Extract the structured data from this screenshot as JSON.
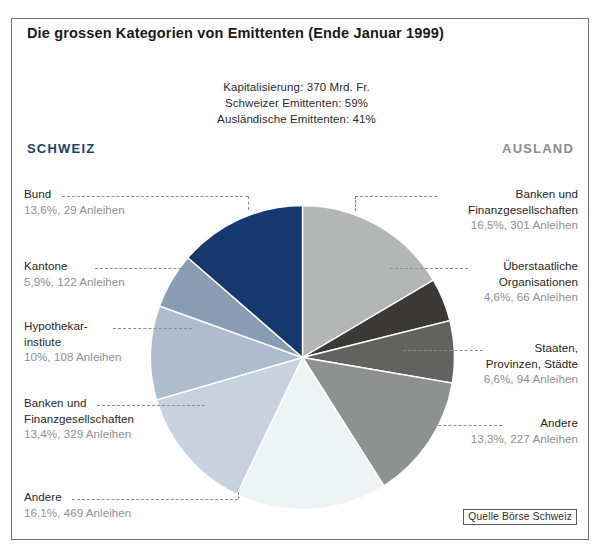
{
  "title": "Die grossen Kategorien von Emittenten (Ende Januar 1999)",
  "subtitle": {
    "line1": "Kapitalisierung: 370 Mrd. Fr.",
    "line2": "Schweizer Emittenten: 59%",
    "line3": "Ausländische Emittenten: 41%"
  },
  "regions": {
    "domestic": "SCHWEIZ",
    "foreign": "AUSLAND"
  },
  "source": "Quelle Börse Schweiz",
  "colors": {
    "navy": "#16386e",
    "schweiz_heading": "#22406b",
    "ausland_heading": "#8b8d90",
    "frame": "#6f7275"
  },
  "chart_data": {
    "type": "pie",
    "title": "Die grossen Kategorien von Emittenten (Ende Januar 1999)",
    "subtitle": "Kapitalisierung: 370 Mrd. Fr. / Schweizer Emittenten: 59% / Ausländische Emittenten: 41%",
    "unit": "%",
    "total_capitalisation": "370 Mrd. Fr.",
    "groups": [
      {
        "name": "SCHWEIZ",
        "share": 59
      },
      {
        "name": "AUSLAND",
        "share": 41
      }
    ],
    "start_angle_deg": 0,
    "slices": [
      {
        "label": "Banken und Finanzgesellschaften",
        "name_line1": "Banken und",
        "name_line2": "Finanzgesellschaften",
        "value": 16.5,
        "value_text": "16,5%, 301 Anleihen",
        "bonds": 301,
        "group": "AUSLAND",
        "color": "#b4b6b6",
        "side": "right"
      },
      {
        "label": "Überstaatliche Organisationen",
        "name_line1": "Überstaatliche",
        "name_line2": "Organisationen",
        "value": 4.6,
        "value_text": "4,6%, 66 Anleihen",
        "bonds": 66,
        "group": "AUSLAND",
        "color": "#3c3835",
        "side": "right"
      },
      {
        "label": "Staaten, Provinzen, Städte",
        "name_line1": "Staaten,",
        "name_line2": "Provinzen, Städte",
        "value": 6.6,
        "value_text": "6,6%, 94 Anleihen",
        "bonds": 94,
        "group": "AUSLAND",
        "color": "#62635f",
        "side": "right"
      },
      {
        "label": "Andere",
        "name_line1": "Andere",
        "name_line2": "",
        "value": 13.3,
        "value_text": "13,3%, 227 Anleihen",
        "bonds": 227,
        "group": "AUSLAND",
        "color": "#8f9090",
        "side": "right"
      },
      {
        "label": "Andere",
        "name_line1": "Andere",
        "name_line2": "",
        "value": 16.1,
        "value_text": "16,1%, 469 Anleihen",
        "bonds": 469,
        "group": "SCHWEIZ",
        "color": "#edf2f5",
        "side": "left"
      },
      {
        "label": "Banken und Finanzgesellschaften",
        "name_line1": "Banken und",
        "name_line2": "Finanzgesellschaften",
        "value": 13.4,
        "value_text": "13,4%, 329 Anleihen",
        "bonds": 329,
        "group": "SCHWEIZ",
        "color": "#c7d2de",
        "side": "left"
      },
      {
        "label": "Hypothekarinstitue",
        "name_line1": "Hypothekar-",
        "name_line2": "instiute",
        "value": 10.0,
        "value_text": "10%, 108 Anleihen",
        "bonds": 108,
        "group": "SCHWEIZ",
        "color": "#aebdcd",
        "side": "left"
      },
      {
        "label": "Kantone",
        "name_line1": "Kantone",
        "name_line2": "",
        "value": 5.9,
        "value_text": "5,9%, 122 Anleihen",
        "bonds": 122,
        "group": "SCHWEIZ",
        "color": "#8a9cb4",
        "side": "left"
      },
      {
        "label": "Bund",
        "name_line1": "Bund",
        "name_line2": "",
        "value": 13.6,
        "value_text": "13,6%, 29 Anleihen",
        "bonds": 29,
        "group": "SCHWEIZ",
        "color": "#16386e",
        "side": "left"
      }
    ]
  },
  "callouts": {
    "left": [
      {
        "l1": "Bund",
        "l2": "",
        "v": "13,6%, 29 Anleihen"
      },
      {
        "l1": "Kantone",
        "l2": "",
        "v": "5,9%, 122 Anleihen"
      },
      {
        "l1": "Hypothekar-",
        "l2": "instiute",
        "v": "10%, 108 Anleihen"
      },
      {
        "l1": "Banken und",
        "l2": "Finanzgesellschaften",
        "v": "13,4%, 329 Anleihen"
      },
      {
        "l1": "Andere",
        "l2": "",
        "v": "16,1%, 469 Anleihen"
      }
    ],
    "right": [
      {
        "l1": "Banken und",
        "l2": "Finanzgesellschaften",
        "v": "16,5%, 301 Anleihen"
      },
      {
        "l1": "Überstaatliche",
        "l2": "Organisationen",
        "v": "4,6%, 66 Anleihen"
      },
      {
        "l1": "Staaten,",
        "l2": "Provinzen, Städte",
        "v": "6,6%, 94 Anleihen"
      },
      {
        "l1": "Andere",
        "l2": "",
        "v": "13,3%, 227 Anleihen"
      }
    ]
  }
}
